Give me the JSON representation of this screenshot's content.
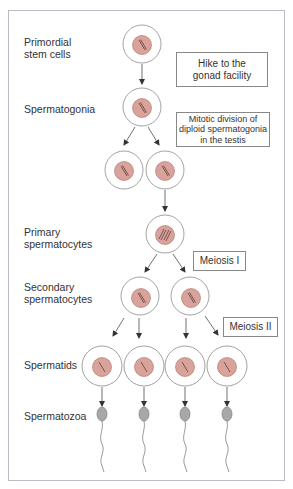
{
  "diagram": {
    "stage_labels": [
      {
        "id": "primordial",
        "line1": "Primordial",
        "line2": "stem cells"
      },
      {
        "id": "spermatogonia",
        "line1": "Spermatogonia",
        "line2": ""
      },
      {
        "id": "primary",
        "line1": "Primary",
        "line2": "spermatocytes"
      },
      {
        "id": "secondary",
        "line1": "Secondary",
        "line2": "spermatocytes"
      },
      {
        "id": "spermatids",
        "line1": "Spermatids",
        "line2": ""
      },
      {
        "id": "spermatozoa",
        "line1": "Spermatozoa",
        "line2": ""
      }
    ],
    "annotations": [
      {
        "id": "hike",
        "line1": "Hike to the",
        "line2": "gonad facility",
        "line3": ""
      },
      {
        "id": "mitotic",
        "line1": "Mitotic division of",
        "line2": "diploid spermatogonia",
        "line3": "in the testis"
      },
      {
        "id": "meiosis1",
        "line1": "Meiosis I",
        "line2": "",
        "line3": ""
      },
      {
        "id": "meiosis2",
        "line1": "Meiosis II",
        "line2": "",
        "line3": ""
      }
    ],
    "colors": {
      "nucleus": "#d9a29a",
      "nucleus_stroke": "#a87068",
      "cell_stroke": "#8a8a8a",
      "sperm_head": "#a8a8a8",
      "frame": "#b8bcc4"
    }
  }
}
